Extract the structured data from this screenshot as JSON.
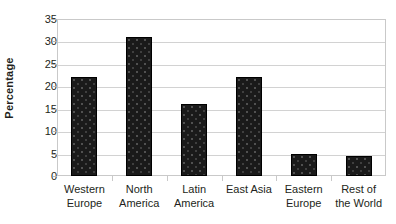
{
  "chart_data": {
    "type": "bar",
    "title": "",
    "xlabel": "",
    "ylabel": "Percentage",
    "categories": [
      "Western Europe",
      "North America",
      "Latin America",
      "East Asia",
      "Eastern Europe",
      "Rest of the World"
    ],
    "category_lines": [
      [
        "Western",
        "Europe"
      ],
      [
        "North",
        "America"
      ],
      [
        "Latin",
        "America"
      ],
      [
        "East Asia",
        ""
      ],
      [
        "Eastern",
        "Europe"
      ],
      [
        "Rest of",
        "the World"
      ]
    ],
    "values": [
      22,
      31,
      16,
      22,
      5,
      4.5
    ],
    "ylim": [
      0,
      35
    ],
    "y_ticks": [
      0,
      5,
      10,
      15,
      20,
      25,
      30,
      35
    ],
    "y_tick_labels": [
      "0",
      "5",
      "10",
      "15",
      "20",
      "25",
      "30",
      "35"
    ],
    "grid": true,
    "legend": false,
    "bar_color": "#1a1a1a",
    "grid_color": "#d2d2d2",
    "axis_color": "#c9c9c9",
    "background": "#ffffff"
  }
}
